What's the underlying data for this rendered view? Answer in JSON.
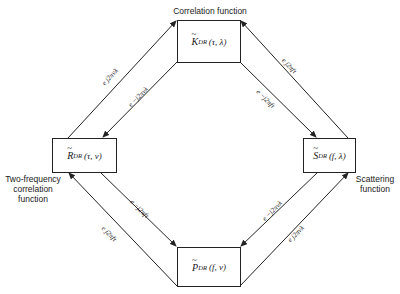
{
  "diagram": {
    "nodes": [
      {
        "id": "K",
        "symbol": "K",
        "subscript": "DR",
        "args": "(τ, λ)",
        "caption": "Correlation function"
      },
      {
        "id": "R",
        "symbol": "R",
        "subscript": "DR",
        "args": "(τ, ν)",
        "caption_lines": [
          "Two-frequency",
          "correlation",
          "function"
        ]
      },
      {
        "id": "S",
        "symbol": "S",
        "subscript": "DR",
        "args": "(f, λ)",
        "caption_lines": [
          "Scattering",
          "function"
        ]
      },
      {
        "id": "P",
        "symbol": "P",
        "subscript": "DR",
        "args": "(f, ν)"
      }
    ],
    "tilde": "~",
    "edges": [
      {
        "from": "R",
        "to": "K",
        "label": "e^{j2πνλ}"
      },
      {
        "from": "K",
        "to": "R",
        "label": "e^{−j2πνλ}"
      },
      {
        "from": "S",
        "to": "K",
        "label": "e^{j2πfτ}"
      },
      {
        "from": "K",
        "to": "S",
        "label": "e^{−j2πfτ}"
      },
      {
        "from": "R",
        "to": "P",
        "label": "e^{−j2πfτ}"
      },
      {
        "from": "P",
        "to": "R",
        "label": "e^{j2πfτ}"
      },
      {
        "from": "S",
        "to": "P",
        "label": "e^{−j2πνλ}"
      },
      {
        "from": "P",
        "to": "S",
        "label": "e^{j2πνλ}"
      }
    ],
    "edge_labels": {
      "rk": "e j2πνλ",
      "kr": "e −j2πνλ",
      "sk": "e j2πfτ",
      "ks": "e −j2πfτ",
      "rp": "e −j2πfτ",
      "pr": "e j2πfτ",
      "sp": "e −j2πνλ",
      "ps": "e j2πνλ"
    }
  }
}
